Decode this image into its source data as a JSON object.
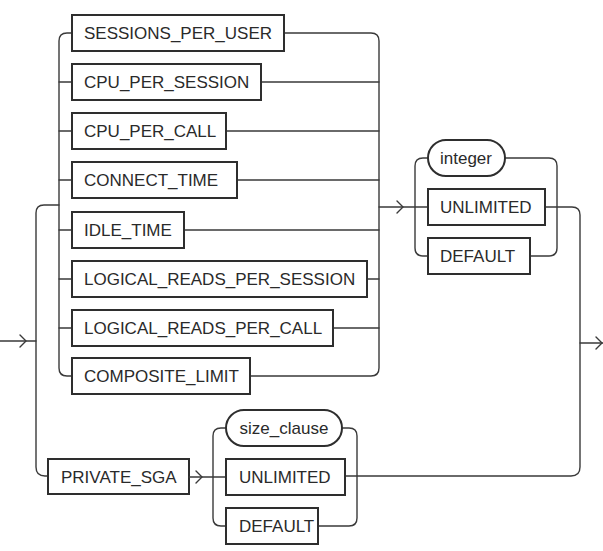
{
  "diagram": {
    "type": "railroad-syntax-diagram",
    "resource_parameters": {
      "options": [
        {
          "label": "SESSIONS_PER_USER",
          "kind": "keyword"
        },
        {
          "label": "CPU_PER_SESSION",
          "kind": "keyword"
        },
        {
          "label": "CPU_PER_CALL",
          "kind": "keyword"
        },
        {
          "label": "CONNECT_TIME",
          "kind": "keyword"
        },
        {
          "label": "IDLE_TIME",
          "kind": "keyword"
        },
        {
          "label": "LOGICAL_READS_PER_SESSION",
          "kind": "keyword"
        },
        {
          "label": "LOGICAL_READS_PER_CALL",
          "kind": "keyword"
        },
        {
          "label": "COMPOSITE_LIMIT",
          "kind": "keyword"
        }
      ],
      "values": [
        {
          "label": "integer",
          "kind": "non-terminal"
        },
        {
          "label": "UNLIMITED",
          "kind": "keyword"
        },
        {
          "label": "DEFAULT",
          "kind": "keyword"
        }
      ]
    },
    "private_sga": {
      "keyword": {
        "label": "PRIVATE_SGA",
        "kind": "keyword"
      },
      "values": [
        {
          "label": "size_clause",
          "kind": "non-terminal"
        },
        {
          "label": "UNLIMITED",
          "kind": "keyword"
        },
        {
          "label": "DEFAULT",
          "kind": "keyword"
        }
      ]
    },
    "colors": {
      "stroke": "#2e2e2e",
      "text": "#2a2a2a",
      "background": "#ffffff"
    }
  }
}
